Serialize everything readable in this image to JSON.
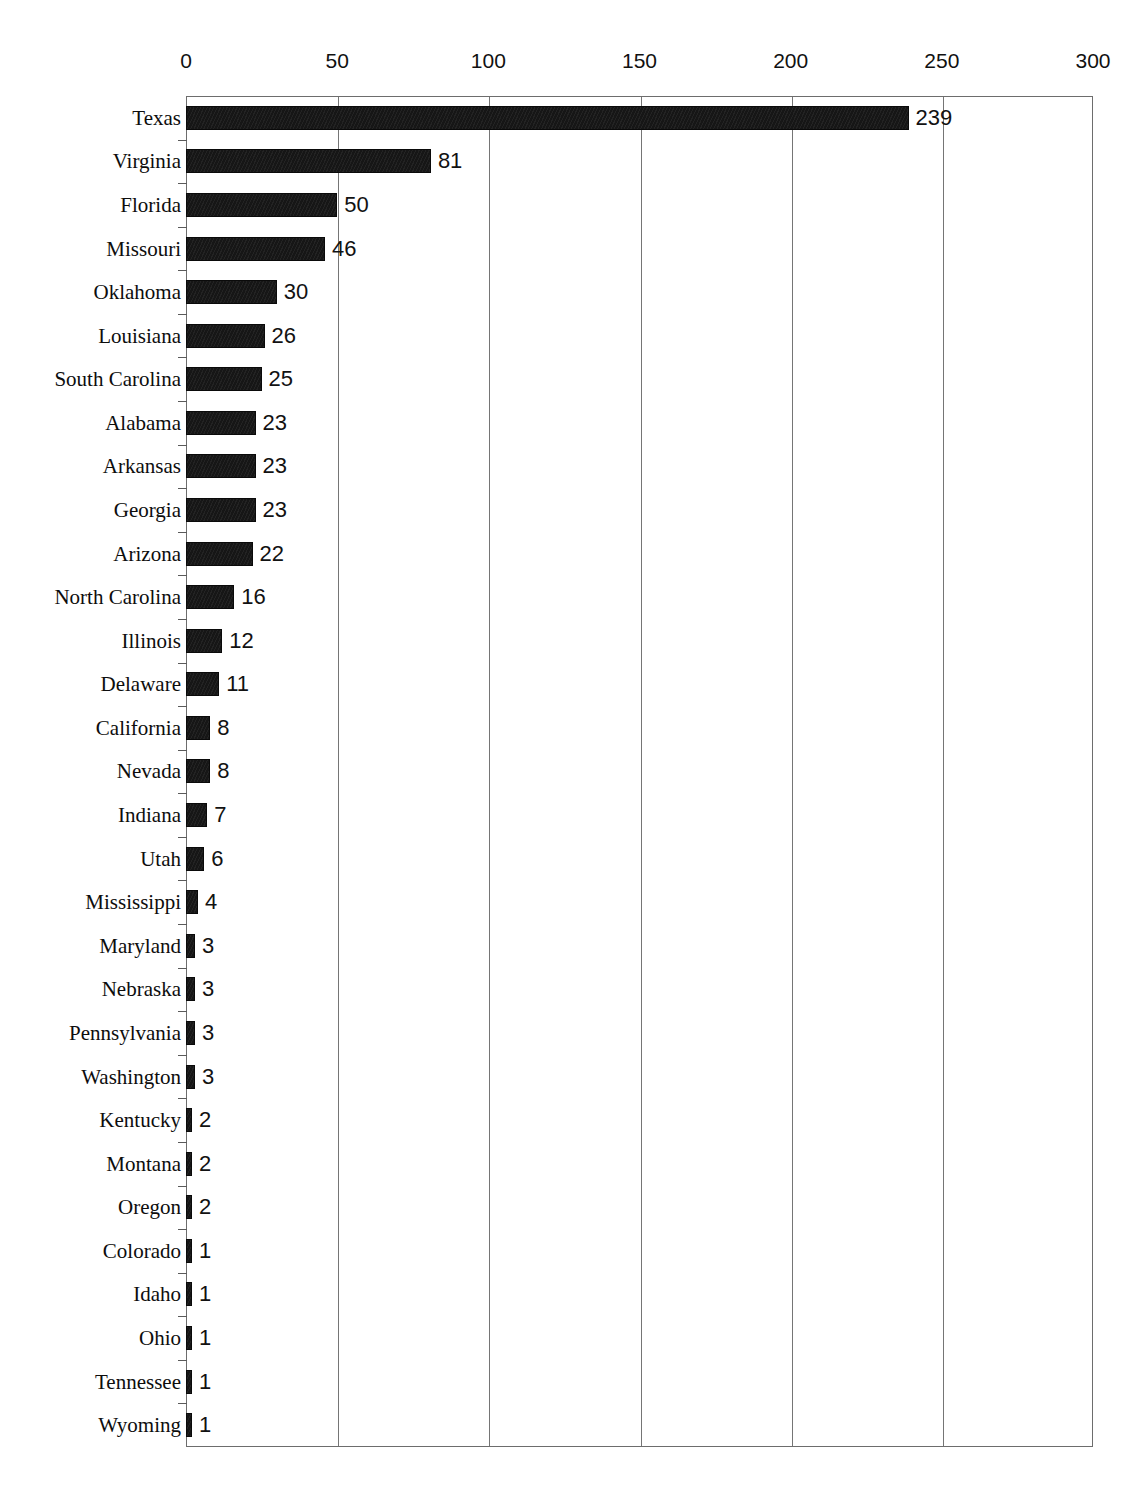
{
  "chart_data": {
    "type": "bar",
    "orientation": "horizontal",
    "title": "",
    "subtitle": "",
    "xlabel": "",
    "ylabel": "",
    "xlim": [
      0,
      300
    ],
    "ylim": null,
    "grid": "vertical",
    "legend": null,
    "xticks": [
      0,
      50,
      100,
      150,
      200,
      250,
      300
    ],
    "xtick_labels": [
      "0",
      "50",
      "100",
      "150",
      "200",
      "250",
      "300"
    ],
    "bar_color": "#161616",
    "gridline_color": "#757575",
    "axis_color": "#6d6d6d",
    "categories": [
      "Texas",
      "Virginia",
      "Florida",
      "Missouri",
      "Oklahoma",
      "Louisiana",
      "South Carolina",
      "Alabama",
      "Arkansas",
      "Georgia",
      "Arizona",
      "North Carolina",
      "Illinois",
      "Delaware",
      "California",
      "Nevada",
      "Indiana",
      "Utah",
      "Mississippi",
      "Maryland",
      "Nebraska",
      "Pennsylvania",
      "Washington",
      "Kentucky",
      "Montana",
      "Oregon",
      "Colorado",
      "Idaho",
      "Ohio",
      "Tennessee",
      "Wyoming"
    ],
    "values": [
      239,
      81,
      50,
      46,
      30,
      26,
      25,
      23,
      23,
      23,
      22,
      16,
      12,
      11,
      8,
      8,
      7,
      6,
      4,
      3,
      3,
      3,
      3,
      2,
      2,
      2,
      1,
      1,
      1,
      1,
      1
    ],
    "data_labels": [
      "239",
      "81",
      "50",
      "46",
      "30",
      "26",
      "25",
      "23",
      "23",
      "23",
      "22",
      "16",
      "12",
      "11",
      "8",
      "8",
      "7",
      "6",
      "4",
      "3",
      "3",
      "3",
      "3",
      "2",
      "2",
      "2",
      "1",
      "1",
      "1",
      "1",
      "1"
    ]
  }
}
